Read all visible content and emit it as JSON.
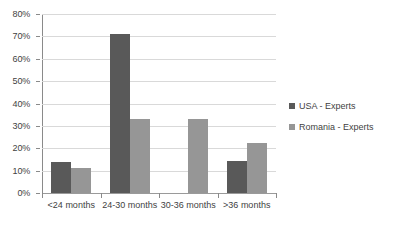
{
  "chart_data": {
    "type": "bar",
    "title": "",
    "xlabel": "",
    "ylabel": "",
    "ylim": [
      0,
      80
    ],
    "ytick_labels": [
      "80%",
      "70%",
      "60%",
      "50%",
      "40%",
      "30%",
      "20%",
      "10%",
      "0%"
    ],
    "ytick_values": [
      80,
      70,
      60,
      50,
      40,
      30,
      20,
      10,
      0
    ],
    "grid": true,
    "legend_position": "right",
    "categories": [
      "<24 months",
      "24-30 months",
      "30-36 months",
      ">36 months"
    ],
    "series": [
      {
        "name": "USA - Experts",
        "color": "#595959",
        "values": [
          14,
          71,
          0,
          14.5
        ]
      },
      {
        "name": "Romania - Experts",
        "color": "#969696",
        "values": [
          11,
          33,
          33,
          22.5
        ]
      }
    ]
  },
  "legend": {
    "items": [
      {
        "label": "USA - Experts",
        "swatch": "legend-swatch-usa"
      },
      {
        "label": "Romania - Experts",
        "swatch": "legend-swatch-romania"
      }
    ]
  }
}
